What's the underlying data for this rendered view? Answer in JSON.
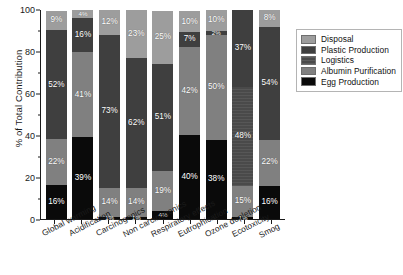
{
  "chart_data": {
    "type": "bar",
    "subtype": "stacked-bar-100-percent",
    "title": "",
    "xlabel": "",
    "ylabel": "% of Total Contribution",
    "ylim": [
      0,
      100
    ],
    "yticks": [
      0,
      20,
      40,
      60,
      80,
      100
    ],
    "ytick_labels": [
      "0",
      "20",
      "40",
      "60",
      "80",
      "100"
    ],
    "grid": false,
    "legend_position": "right",
    "categories": [
      "Global warming",
      "Acidification",
      "Carcinogenics",
      "Non carcinogenics",
      "Respiratory effects",
      "Eutrophication",
      "Ozone depletion",
      "Ecotoxicity",
      "Smog"
    ],
    "series": [
      {
        "name": "Disposal",
        "color": "#9d9d9d",
        "values": [
          9,
          4,
          12,
          23,
          25,
          10,
          10,
          0,
          8
        ],
        "labels": [
          "9%",
          "4%",
          "12%",
          "23%",
          "25%",
          "10%",
          "10%",
          "",
          "8%"
        ]
      },
      {
        "name": "Plastic Production",
        "color": "#3f3f3f",
        "values": [
          52,
          16,
          73,
          62,
          51,
          7,
          2,
          37,
          54
        ],
        "labels": [
          "52%",
          "16%",
          "73%",
          "62%",
          "51%",
          "7%",
          "2%",
          "37%",
          "54%"
        ]
      },
      {
        "name": "Logistics",
        "color": "#4a4a4a",
        "values": [
          0,
          0,
          0,
          0,
          0,
          0,
          0,
          48,
          0
        ],
        "labels": [
          "",
          "",
          "",
          "",
          "",
          "",
          "",
          "48%",
          ""
        ]
      },
      {
        "name": "Albumin Purification",
        "color": "#808080",
        "values": [
          22,
          41,
          14,
          14,
          19,
          42,
          50,
          15,
          22
        ],
        "labels": [
          "22%",
          "41%",
          "14%",
          "14%",
          "19%",
          "42%",
          "50%",
          "15%",
          "22%"
        ]
      },
      {
        "name": "Egg Production",
        "color": "#0a0a0a",
        "values": [
          16,
          39,
          1,
          1,
          4,
          40,
          38,
          1,
          16
        ],
        "labels": [
          "16%",
          "39%",
          "1%",
          "1%",
          "4%",
          "40%",
          "38%",
          "1%",
          "16%"
        ]
      }
    ]
  },
  "axes": {
    "ylabel": "% of Total Contribution",
    "ytick_labels": [
      "100",
      "80",
      "60",
      "40",
      "20",
      "0"
    ],
    "xtick_labels": [
      "Global warming",
      "Acidification",
      "Carcinogenics",
      "Non carcinogenics",
      "Respiratory effects",
      "Eutrophication",
      "Ozone depletion",
      "Ecotoxicity",
      "Smog"
    ]
  },
  "legend": {
    "items": [
      {
        "label": "Disposal",
        "color": "#9d9d9d"
      },
      {
        "label": "Plastic Production",
        "color": "#3f3f3f"
      },
      {
        "label": "Logistics",
        "color": "#4a4a4a"
      },
      {
        "label": "Albumin Purification",
        "color": "#808080"
      },
      {
        "label": "Egg Production",
        "color": "#0a0a0a"
      }
    ]
  }
}
